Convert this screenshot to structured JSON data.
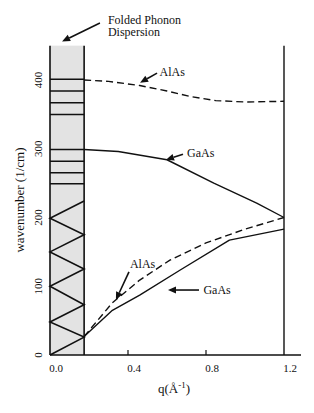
{
  "chart_data": {
    "type": "line",
    "title": "",
    "xlabel": "q(Å-1)",
    "xlabel_parts": {
      "base": "q(Å",
      "sup": "-1",
      "close": ")"
    },
    "ylabel": "wavenumber (1/cm)",
    "xlim": [
      0.0,
      1.2
    ],
    "ylim": [
      0,
      450
    ],
    "xticks": [
      0.0,
      0.4,
      0.8,
      1.2
    ],
    "xtick_labels": [
      "0.0",
      "0.4",
      "0.8",
      "1.2"
    ],
    "yticks": [
      0,
      100,
      200,
      300,
      400
    ],
    "ytick_labels": [
      "0",
      "100",
      "200",
      "300",
      "400"
    ],
    "grid": false,
    "legend": null,
    "folded_zone": {
      "q_range": [
        0.0,
        0.175
      ],
      "w_range": [
        0,
        450
      ],
      "fill": "#e3e3e3",
      "horizontal_lines": [
        401,
        384,
        367,
        350,
        299,
        282,
        265,
        249
      ],
      "zigzag": [
        [
          0,
          0
        ],
        [
          0.175,
          26
        ],
        [
          0,
          48
        ],
        [
          0.175,
          73
        ],
        [
          0,
          100
        ],
        [
          0.175,
          125
        ],
        [
          0,
          150
        ],
        [
          0.175,
          175
        ],
        [
          0,
          199
        ],
        [
          0.175,
          224
        ]
      ]
    },
    "series": [
      {
        "name": "AlAs optical",
        "style": "dashed",
        "points": [
          [
            0.175,
            400
          ],
          [
            0.3,
            398
          ],
          [
            0.46,
            392
          ],
          [
            0.6,
            384
          ],
          [
            0.72,
            376
          ],
          [
            0.85,
            370
          ],
          [
            1.0,
            368
          ],
          [
            1.2,
            369
          ]
        ]
      },
      {
        "name": "GaAs optical",
        "style": "solid",
        "points": [
          [
            0.175,
            299
          ],
          [
            0.35,
            296
          ],
          [
            0.6,
            284
          ],
          [
            0.84,
            250
          ],
          [
            1.06,
            221
          ],
          [
            1.2,
            200
          ]
        ]
      },
      {
        "name": "AlAs acoustic",
        "style": "dashed",
        "points": [
          [
            0.175,
            27
          ],
          [
            0.32,
            76
          ],
          [
            0.46,
            109
          ],
          [
            0.615,
            138
          ],
          [
            0.8,
            163
          ],
          [
            1.0,
            183
          ],
          [
            1.2,
            200
          ]
        ]
      },
      {
        "name": "GaAs acoustic",
        "style": "solid",
        "points": [
          [
            0.175,
            27
          ],
          [
            0.32,
            65
          ],
          [
            0.46,
            87
          ],
          [
            0.67,
            124
          ],
          [
            0.92,
            167
          ],
          [
            1.2,
            183
          ]
        ]
      }
    ],
    "annotations": [
      {
        "lines": [
          "Folded Phonon",
          "Dispersion"
        ],
        "text_at": [
          0.297,
          481
        ],
        "arrow_from": [
          0.256,
          483
        ],
        "arrow_to": [
          0.062,
          456
        ]
      },
      {
        "lines": [
          "AlAs"
        ],
        "text_at": [
          0.562,
          406
        ],
        "arrow_from": [
          0.549,
          410
        ],
        "arrow_to": [
          0.462,
          396
        ]
      },
      {
        "lines": [
          "GaAs"
        ],
        "text_at": [
          0.703,
          288
        ],
        "arrow_from": [
          0.682,
          292
        ],
        "arrow_to": [
          0.595,
          284
        ]
      },
      {
        "lines": [
          "AlAs"
        ],
        "text_at": [
          0.41,
          127
        ],
        "arrow_from": [
          0.405,
          121
        ],
        "arrow_to": [
          0.338,
          80
        ]
      },
      {
        "lines": [
          "GaAs"
        ],
        "text_at": [
          0.787,
          89
        ],
        "arrow_from": [
          0.764,
          94.5
        ],
        "arrow_to": [
          0.605,
          94.5
        ]
      }
    ]
  },
  "layout": {
    "x0_px": 50,
    "x_px_per_unit": 195,
    "y0_px": 355,
    "y_px_per_unit": 0.6875,
    "x_axis_end_px": 301,
    "colors": {
      "ink": "#111111",
      "band": "#e3e3e3"
    }
  }
}
